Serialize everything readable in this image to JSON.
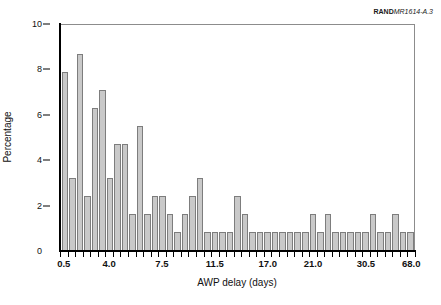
{
  "credit": {
    "brand": "RAND",
    "code": "MR1614-A.3"
  },
  "chart_data": {
    "type": "bar",
    "title": "",
    "subtitle": "",
    "xlabel": "AWP delay (days)",
    "ylabel": "Percentage",
    "ylim": [
      0,
      10
    ],
    "ytick_labels": [
      "0",
      "2",
      "4",
      "6",
      "8",
      "10"
    ],
    "ytick_values": [
      0,
      2,
      4,
      6,
      8,
      10
    ],
    "grid": false,
    "legend": null,
    "legend_position": "none",
    "bar_fill_color": "#c9c9c9",
    "bar_edge_color": "#7d7d7d",
    "axis_color": "#000000",
    "frame_color": "#8c8c8c",
    "background_color": "#ffffff",
    "xtick_labels": [
      "0.5",
      "4.0",
      "7.5",
      "11.5",
      "17.0",
      "21.0",
      "30.5",
      "68.0"
    ],
    "xtick_label_positions": [
      0,
      6,
      13,
      20,
      27,
      33,
      40,
      46
    ],
    "categories": [
      "0.5",
      "1.0",
      "1.5",
      "2.0",
      "2.5",
      "3.0",
      "3.5",
      "4.0",
      "4.5",
      "5.0",
      "5.5",
      "6.0",
      "6.5",
      "7.0",
      "7.5",
      "8.0",
      "8.5",
      "9.0",
      "9.5",
      "10.0",
      "10.5",
      "11.0",
      "11.5",
      "12.0",
      "12.5",
      "13.0",
      "14.0",
      "15.0",
      "16.0",
      "17.0",
      "18.0",
      "19.0",
      "20.0",
      "21.0",
      "22.0",
      "23.0",
      "24.0",
      "25.0",
      "26.5",
      "28.0",
      "30.5",
      "33.0",
      "36.0",
      "40.0",
      "48.0",
      "56.0",
      "68.0"
    ],
    "values": [
      7.9,
      3.2,
      8.7,
      2.4,
      6.3,
      7.1,
      3.2,
      4.7,
      4.7,
      1.6,
      5.5,
      1.6,
      2.4,
      2.4,
      1.6,
      0.8,
      1.6,
      2.4,
      3.2,
      0.8,
      0.8,
      0.8,
      0.8,
      2.4,
      1.6,
      0.8,
      0.8,
      0.8,
      0.8,
      0.8,
      0.8,
      0.8,
      0.8,
      1.6,
      0.8,
      1.6,
      0.8,
      0.8,
      0.8,
      0.8,
      0.8,
      1.6,
      0.8,
      0.8,
      1.6,
      0.8,
      0.8
    ]
  }
}
